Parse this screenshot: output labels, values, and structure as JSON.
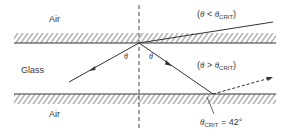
{
  "diagram": {
    "title": "",
    "regions": {
      "air_top": "Air",
      "glass": "Glass",
      "air_bottom": "Air"
    },
    "angle_symbol": "θ",
    "labels": {
      "incident_angle": "θ",
      "reflected_angle": "θ",
      "case_less": {
        "open": "(",
        "theta": "θ",
        "op": " < ",
        "theta2": "θ",
        "sub": "CRIT",
        "close": ")"
      },
      "case_greater": {
        "open": "(",
        "theta": "θ",
        "op": " > ",
        "theta2": "θ",
        "sub": "CRIT",
        "close": ")"
      },
      "critical": {
        "theta": "θ",
        "sub": "CRIT",
        "eq": " = 42°"
      }
    },
    "critical_angle_deg": 42,
    "colors": {
      "line": "#3a3a3a",
      "hatch": "#555555",
      "background": "#ffffff"
    }
  }
}
